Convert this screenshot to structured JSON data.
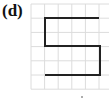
{
  "panel": {
    "label": "(d)"
  },
  "grid": {
    "columns": 6,
    "rows": 6,
    "origin_x": 31,
    "origin_y": 4,
    "cell_w": 13.6,
    "cell_h": 14.2,
    "line_color": "#dcdcdc"
  },
  "path": {
    "color": "#222222",
    "width": 2,
    "points": [
      [
        45,
        18
      ],
      [
        99,
        18
      ],
      [
        45,
        18
      ],
      [
        45,
        46
      ],
      [
        100,
        46
      ],
      [
        100,
        75
      ],
      [
        45,
        75
      ]
    ]
  },
  "marks": {
    "dot": {
      "x": 82,
      "y": 97
    }
  }
}
